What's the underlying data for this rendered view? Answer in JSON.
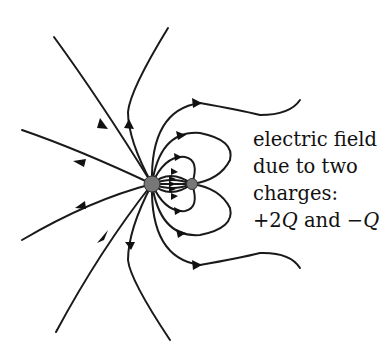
{
  "caption": {
    "line1": "electric field",
    "line2": "due to two",
    "line3": "charges:",
    "line4_prefix": "+2",
    "line4_q1": "Q",
    "line4_mid": " and −",
    "line4_q2": "Q"
  },
  "charges": [
    {
      "label": "+2Q",
      "x": 152,
      "y": 184,
      "r": 8,
      "color": "#777777"
    },
    {
      "label": "-Q",
      "x": 192,
      "y": 184,
      "r": 5.5,
      "color": "#777777"
    }
  ],
  "colors": {
    "line": "#1a1a1a",
    "text": "#111111"
  }
}
